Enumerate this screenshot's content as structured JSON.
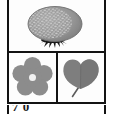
{
  "figure": {
    "border_color": "#131313",
    "background_color": "#ffffff",
    "panels": [
      {
        "id": "panel-fruit",
        "position": "top",
        "subject": "berry-fruit",
        "label": "Fruit",
        "description": "Oval textured berry with dimpled surface and dark sepals at the base",
        "fill_color": "#8f8f8f",
        "shade_color": "#a8a8a8",
        "detail_color": "#cfcfcf",
        "stem_color": "#1d1d1d"
      },
      {
        "id": "panel-flower",
        "position": "bottom-left",
        "subject": "flower",
        "label": "Flower",
        "description": "Five-petal rounded flower with a pale circular center",
        "fill_color": "#8c8c8c",
        "center_color": "#f2f2f2"
      },
      {
        "id": "panel-leaf",
        "position": "bottom-right",
        "subject": "leaf",
        "label": "Leaf",
        "description": "Heart-shaped cordate leaf with a slender petiole",
        "fill_color": "#7e7e7e",
        "shade_color": "#6a6a6a",
        "petiole_color": "#5c5c5c"
      }
    ],
    "caption": {
      "text": "7 0",
      "clipped": true,
      "note": "Caption row is cropped at the bottom edge of the image"
    }
  }
}
